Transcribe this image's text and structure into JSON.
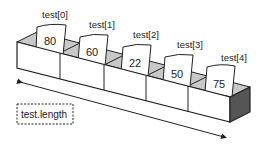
{
  "diagram": {
    "elements": [
      {
        "label": "test[0]",
        "value": "80"
      },
      {
        "label": "test[1]",
        "value": "60"
      },
      {
        "label": "test[2]",
        "value": "22"
      },
      {
        "label": "test[3]",
        "value": "50"
      },
      {
        "label": "test[4]",
        "value": "75"
      }
    ],
    "length_label": "test.length",
    "colors": {
      "stroke": "#222222",
      "box_front": "#ffffff",
      "box_inner": "#c8c8c8",
      "box_side": "#555555",
      "card": "#ffffff"
    }
  }
}
